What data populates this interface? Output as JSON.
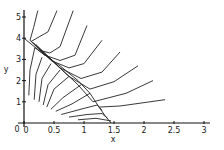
{
  "chart_data": {
    "type": "line",
    "title": "",
    "xlabel": "x",
    "ylabel": "y",
    "xlim": [
      0,
      3.1
    ],
    "ylim": [
      0,
      5.2
    ],
    "grid": false,
    "legend": null,
    "x_ticks": [
      "0",
      "0.5",
      "1",
      "1.5",
      "2",
      "2.5",
      "3"
    ],
    "x_tick_values": [
      0,
      0.5,
      1,
      1.5,
      2,
      2.5,
      3
    ],
    "y_ticks": [
      "0",
      "1",
      "2",
      "3",
      "4",
      "5"
    ],
    "y_tick_values": [
      0,
      1,
      2,
      3,
      4,
      5
    ],
    "annotations": [
      "phase portrait: trajectories converge onto separatrix from (0,4) to (1.45,0), then diverge toward upper right"
    ],
    "series": [
      {
        "name": "traj-1",
        "points": [
          [
            0.23,
            5.3
          ],
          [
            0.16,
            4.5
          ],
          [
            0.1,
            3.9
          ],
          [
            0.3,
            3.4
          ],
          [
            0.43,
            3.3
          ],
          [
            0.6,
            3.6
          ],
          [
            0.82,
            5.3
          ]
        ]
      },
      {
        "name": "traj-2",
        "points": [
          [
            0.55,
            5.3
          ],
          [
            0.4,
            4.3
          ],
          [
            0.12,
            3.85
          ],
          [
            0.35,
            3.2
          ],
          [
            0.6,
            2.95
          ],
          [
            0.85,
            3.2
          ],
          [
            1.05,
            4.6
          ]
        ]
      },
      {
        "name": "traj-3",
        "points": [
          [
            0.15,
            3.8
          ],
          [
            0.45,
            2.95
          ],
          [
            0.75,
            2.6
          ],
          [
            1.0,
            2.8
          ],
          [
            1.3,
            3.9
          ]
        ]
      },
      {
        "name": "traj-4",
        "points": [
          [
            0.2,
            3.7
          ],
          [
            0.6,
            2.6
          ],
          [
            0.95,
            2.1
          ],
          [
            1.3,
            2.4
          ],
          [
            1.6,
            3.35
          ]
        ]
      },
      {
        "name": "traj-5",
        "points": [
          [
            0.25,
            3.5
          ],
          [
            0.75,
            2.2
          ],
          [
            1.1,
            1.6
          ],
          [
            1.5,
            1.95
          ],
          [
            1.9,
            2.7
          ]
        ]
      },
      {
        "name": "traj-6",
        "points": [
          [
            0.3,
            3.4
          ],
          [
            0.9,
            1.8
          ],
          [
            1.15,
            1.0
          ],
          [
            1.7,
            1.4
          ],
          [
            2.15,
            2.0
          ]
        ]
      },
      {
        "name": "traj-7",
        "points": [
          [
            1.25,
            0.75
          ],
          [
            1.6,
            0.8
          ],
          [
            2.35,
            1.1
          ]
        ]
      },
      {
        "name": "traj-8",
        "points": [
          [
            0.08,
            1.3
          ],
          [
            0.1,
            2.5
          ],
          [
            0.18,
            3.55
          ],
          [
            0.35,
            3.2
          ]
        ]
      },
      {
        "name": "traj-9",
        "points": [
          [
            0.17,
            1.1
          ],
          [
            0.2,
            2.3
          ],
          [
            0.3,
            3.1
          ]
        ]
      },
      {
        "name": "traj-10",
        "points": [
          [
            0.25,
            1.0
          ],
          [
            0.3,
            2.1
          ],
          [
            0.45,
            2.8
          ]
        ]
      },
      {
        "name": "traj-11",
        "points": [
          [
            0.32,
            0.85
          ],
          [
            0.4,
            1.8
          ],
          [
            0.6,
            2.5
          ]
        ]
      },
      {
        "name": "traj-12",
        "points": [
          [
            0.38,
            0.75
          ],
          [
            0.5,
            1.6
          ],
          [
            0.75,
            2.2
          ]
        ]
      },
      {
        "name": "traj-13",
        "points": [
          [
            0.45,
            0.65
          ],
          [
            0.65,
            1.2
          ],
          [
            0.95,
            1.8
          ]
        ]
      },
      {
        "name": "traj-14",
        "points": [
          [
            0.53,
            0.55
          ],
          [
            0.8,
            0.9
          ],
          [
            1.1,
            1.4
          ]
        ]
      },
      {
        "name": "traj-15",
        "points": [
          [
            0.62,
            0.4
          ],
          [
            0.95,
            0.65
          ],
          [
            1.22,
            0.85
          ],
          [
            1.3,
            0.6
          ]
        ]
      },
      {
        "name": "traj-16",
        "points": [
          [
            0.75,
            0.28
          ],
          [
            1.05,
            0.4
          ],
          [
            1.3,
            0.45
          ],
          [
            1.4,
            0.2
          ]
        ]
      },
      {
        "name": "traj-17",
        "points": [
          [
            0.9,
            0.15
          ],
          [
            1.2,
            0.22
          ],
          [
            1.45,
            0.1
          ]
        ]
      },
      {
        "name": "separatrix",
        "points": [
          [
            0,
            4
          ],
          [
            0.3,
            3.3
          ],
          [
            0.6,
            2.7
          ],
          [
            0.9,
            2.0
          ],
          [
            1.1,
            1.4
          ],
          [
            1.25,
            0.75
          ],
          [
            1.35,
            0.35
          ],
          [
            1.45,
            0.0
          ]
        ]
      }
    ]
  },
  "axes": {
    "x_label": "x",
    "y_label": "y",
    "origin_labels": [
      "0",
      "0"
    ]
  }
}
